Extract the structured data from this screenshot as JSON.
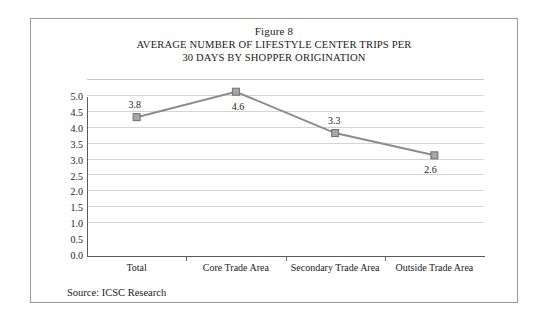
{
  "figure": {
    "number_label": "Figure 8",
    "title_line_1": "AVERAGE NUMBER OF LIFESTYLE CENTER TRIPS PER",
    "title_line_2": "30 DAYS BY SHOPPER ORIGINATION",
    "source_note": "Source: ICSC Research"
  },
  "chart_data": {
    "type": "line",
    "title": "AVERAGE NUMBER OF LIFESTYLE CENTER TRIPS PER 30 DAYS BY SHOPPER ORIGINATION",
    "subtitle": "Figure 8",
    "categories": [
      "Total",
      "Core Trade Area",
      "Secondary Trade Area",
      "Outside Trade Area"
    ],
    "values": [
      3.8,
      4.6,
      3.3,
      2.6
    ],
    "data_labels": [
      "3.8",
      "4.6",
      "3.3",
      "2.6"
    ],
    "xlabel": "",
    "ylabel": "",
    "ylim": [
      0.0,
      5.0
    ],
    "ytick_step": 0.5,
    "ytick_labels": [
      "5.0",
      "4.5",
      "4.0",
      "3.5",
      "3.0",
      "2.5",
      "2.0",
      "1.5",
      "1.0",
      "0.5",
      "0.0"
    ],
    "grid": true,
    "grid_axis": "y",
    "legend": false,
    "legend_position": "none",
    "marker": "square",
    "series_color": "#8c8c8c",
    "marker_fill": "#a6a6a6",
    "marker_edge": "#6e6e6e",
    "gridline_color": "#d4d4d4",
    "axis_color": "#5a5a5a"
  }
}
